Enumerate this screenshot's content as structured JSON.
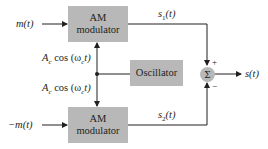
{
  "diagram": {
    "title": "",
    "blocks": {
      "top_modulator": {
        "line1": "AM",
        "line2": "modulator"
      },
      "bottom_modulator": {
        "line1": "AM",
        "line2": "modulator"
      },
      "oscillator": {
        "label": "Oscillator"
      },
      "summer": {
        "symbol": "Σ",
        "plus_sign": "+",
        "minus_sign": "−"
      }
    },
    "signals": {
      "input_top": "m(t)",
      "input_bottom": "−m(t)",
      "carrier_top": "A",
      "carrier_top_sub": "c",
      "carrier_top_rest": " cos (ω",
      "carrier_top_sub2": "c",
      "carrier_top_end": "t)",
      "carrier_bottom": "A",
      "carrier_bottom_sub": "c",
      "carrier_bottom_rest": " cos (ω",
      "carrier_bottom_sub2": "c",
      "carrier_bottom_end": "t)",
      "s1": "s",
      "s1_sub": "1",
      "s1_end": "(t)",
      "s2": "s",
      "s2_sub": "2",
      "s2_end": "(t)",
      "output": "s(t)"
    },
    "colors": {
      "block_fill": "#b8b8b8",
      "line": "#231f20"
    }
  }
}
